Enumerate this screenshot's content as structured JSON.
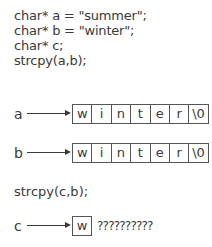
{
  "code_lines": [
    "char* a = \"summer\";",
    "char* b = \"winter\";",
    "char* c;",
    "strcpy(a,b);"
  ],
  "rows": [
    {
      "label": "a",
      "cells": [
        "w",
        "i",
        "n",
        "t",
        "e",
        "r",
        "\\0"
      ]
    },
    {
      "label": "b",
      "cells": [
        "w",
        "i",
        "n",
        "t",
        "e",
        "r",
        "\\0"
      ]
    }
  ],
  "second_statement": "strcpy(c,b);",
  "c_row": {
    "label": "c",
    "cell": "w",
    "garbage": "??????????"
  }
}
